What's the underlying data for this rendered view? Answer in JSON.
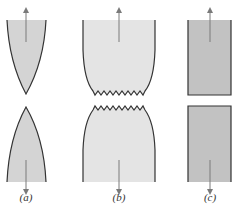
{
  "figure": {
    "colors": {
      "fill_a": "#d4d4d4",
      "fill_b": "#e4e4e4",
      "fill_c": "#c2c2c2",
      "outline": "#333333",
      "arrow": "#7a7a7a"
    },
    "panels": [
      {
        "id": "a",
        "label": "(a)",
        "description": "Highly ductile fracture: specimen necks down to a point"
      },
      {
        "id": "b",
        "label": "(b)",
        "description": "Moderately ductile fracture after some necking"
      },
      {
        "id": "c",
        "label": "(c)",
        "description": "Brittle fracture without plastic deformation"
      }
    ]
  }
}
